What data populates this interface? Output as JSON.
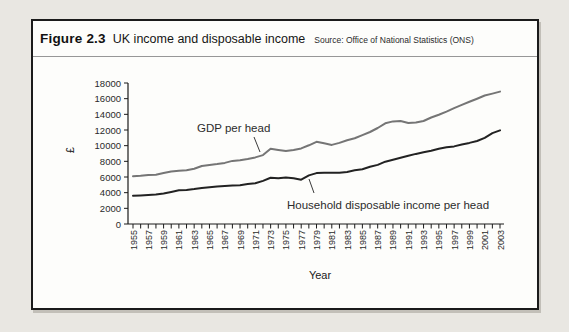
{
  "figure": {
    "label": "Figure 2.3",
    "title": "UK income and disposable income",
    "source": "Source: Office of National Statistics (ONS)"
  },
  "chart_data": {
    "type": "line",
    "title": "UK income and disposable income",
    "source": "Source: Office of National Statistics (ONS)",
    "xlabel": "Year",
    "ylabel": "£",
    "x_start": 1955,
    "x_end": 2003,
    "x_tick_every_years": 1,
    "x_label_every_years": 2,
    "ylim": [
      0,
      18000
    ],
    "y_tick_step": 2000,
    "grid": false,
    "legend_position": "inline-annotations",
    "axis_color": "#1a1a1a",
    "tick_label_color": "#2a2a2a",
    "series": [
      {
        "name": "GDP per head",
        "color": "#757575",
        "values": [
          6100,
          6150,
          6250,
          6300,
          6500,
          6700,
          6800,
          6850,
          7050,
          7400,
          7550,
          7650,
          7800,
          8050,
          8150,
          8300,
          8500,
          8800,
          9600,
          9450,
          9300,
          9450,
          9650,
          10050,
          10500,
          10300,
          10100,
          10350,
          10700,
          10950,
          11350,
          11750,
          12250,
          12850,
          13100,
          13150,
          12900,
          12950,
          13150,
          13600,
          13950,
          14350,
          14800,
          15200,
          15600,
          16000,
          16400,
          16650,
          16900
        ]
      },
      {
        "name": "Household disposable income per head",
        "color": "#222222",
        "values": [
          3600,
          3650,
          3700,
          3750,
          3900,
          4100,
          4300,
          4350,
          4450,
          4600,
          4700,
          4800,
          4850,
          4900,
          4950,
          5100,
          5200,
          5500,
          5900,
          5850,
          5950,
          5850,
          5650,
          6200,
          6500,
          6550,
          6550,
          6550,
          6650,
          6850,
          7000,
          7300,
          7550,
          7950,
          8200,
          8450,
          8700,
          8950,
          9150,
          9350,
          9600,
          9800,
          9900,
          10150,
          10350,
          10600,
          11000,
          11600,
          11950
        ]
      }
    ],
    "annotations": [
      {
        "text": "GDP per head"
      },
      {
        "text": "Household disposable income per head"
      }
    ]
  }
}
